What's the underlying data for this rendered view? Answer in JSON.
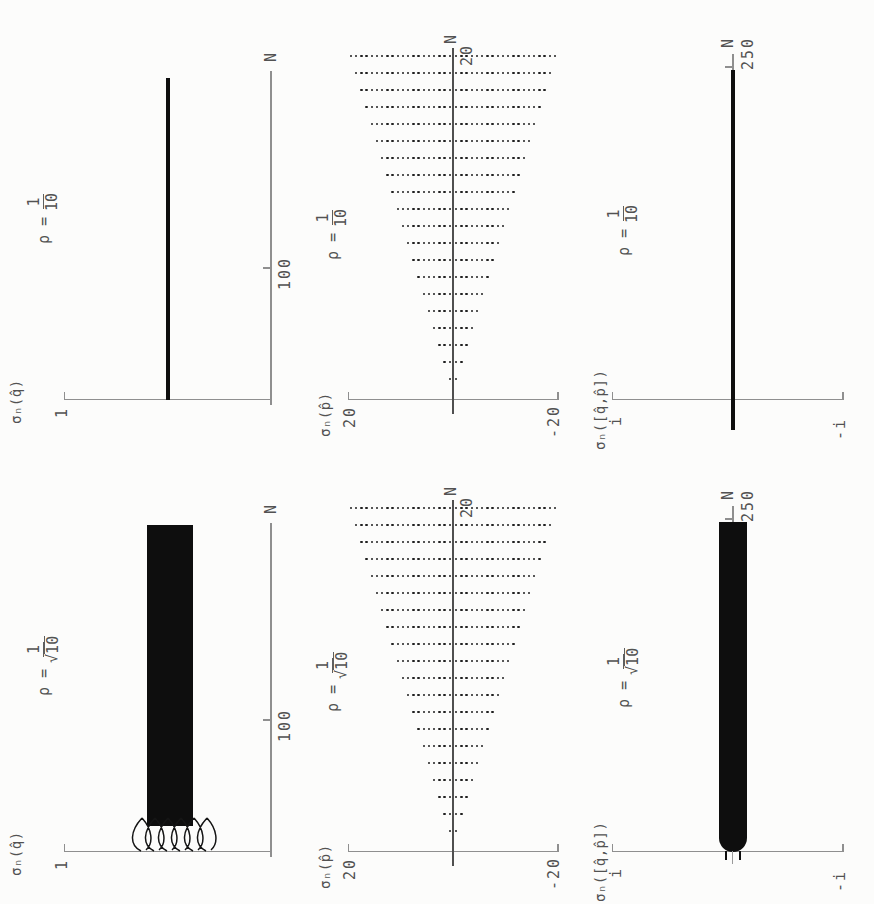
{
  "figure": {
    "background": "#fcfcfb",
    "ink_color": "#0e0e0e",
    "axis_color": "#8f8f8f",
    "text_color": "#525252",
    "orientation": "plots rotated 90 degrees counter-clockwise on the scanned page",
    "grid_layout": "3 columns (q, p, commutator) by 2 rows (rho=1/10, rho=1/sqrt(10))"
  },
  "plots": [
    {
      "id": "sigma-q-rho-1-10",
      "ylabel": "σₙ(q̂)",
      "y_tick_label": "1",
      "x_tick_label": "100",
      "xlabel": "N",
      "title": {
        "prefix": "ρ =",
        "numerator": "1",
        "denominator": "10",
        "sqrt_sign": "",
        "radical": false
      }
    },
    {
      "id": "sigma-p-rho-1-10",
      "ylabel": "σₙ(p̂)",
      "y_tick_top_label": "20",
      "y_tick_bottom_label": "-20",
      "x_tick_label": "20",
      "xlabel": "N",
      "title": {
        "prefix": "ρ =",
        "numerator": "1",
        "denominator": "10",
        "sqrt_sign": "",
        "radical": false
      }
    },
    {
      "id": "sigma-comm-rho-1-10",
      "ylabel": "σₙ([q̂,p̂])",
      "y_tick_top_label": "i",
      "y_tick_bottom_label": "-i",
      "x_tick_label": "250",
      "xlabel": "N",
      "title": {
        "prefix": "ρ =",
        "numerator": "1",
        "denominator": "10",
        "sqrt_sign": "",
        "radical": false
      }
    },
    {
      "id": "sigma-q-rho-1-sqrt10",
      "ylabel": "σₙ(q̂)",
      "y_tick_label": "1",
      "x_tick_label": "100",
      "xlabel": "N",
      "title": {
        "prefix": "ρ =",
        "numerator": "1",
        "denominator": "10",
        "sqrt_sign": "√",
        "radical": true
      }
    },
    {
      "id": "sigma-p-rho-1-sqrt10",
      "ylabel": "σₙ(p̂)",
      "y_tick_top_label": "20",
      "y_tick_bottom_label": "-20",
      "x_tick_label": "20",
      "xlabel": "N",
      "title": {
        "prefix": "ρ =",
        "numerator": "1",
        "denominator": "10",
        "sqrt_sign": "√",
        "radical": true
      }
    },
    {
      "id": "sigma-comm-rho-1-sqrt10",
      "ylabel": "σₙ([q̂,p̂])",
      "y_tick_top_label": "i",
      "y_tick_bottom_label": "-i",
      "x_tick_label": "250",
      "xlabel": "N",
      "title": {
        "prefix": "ρ =",
        "numerator": "1",
        "denominator": "10",
        "sqrt_sign": "√",
        "radical": true
      }
    }
  ],
  "chart_data": [
    {
      "id": "sigma_q_rho_1_over_10",
      "type": "line",
      "title": "ρ = 1/10",
      "xlabel": "N",
      "ylabel": "σ_N(q̂)",
      "x_range": [
        0,
        255
      ],
      "x_ticks": [
        100
      ],
      "y_ticks": [
        1
      ],
      "grid": false,
      "legend": "none",
      "series": [
        {
          "name": "σ_N(q̂)",
          "style": "solid thick line",
          "x_span": [
            0,
            244
          ],
          "y_constant": 0.5
        }
      ],
      "note": "variance of q̂ stays constant at ≈0.5 for all N"
    },
    {
      "id": "sigma_p_rho_1_over_10",
      "type": "scatter",
      "title": "ρ = 1/10",
      "xlabel": "N",
      "ylabel": "σ_N(p̂)",
      "x_range": [
        0,
        21
      ],
      "x_ticks": [
        20
      ],
      "y_range": [
        -21,
        21
      ],
      "y_ticks": [
        20,
        -20
      ],
      "grid": false,
      "N_values": [
        1,
        2,
        3,
        4,
        5,
        6,
        7,
        8,
        9,
        10,
        11,
        12,
        13,
        14,
        15,
        16,
        17,
        18,
        19,
        20
      ],
      "sigma_rule": "for each N there are dots at σ = ±1, ±2, …, ±N (no dot at σ=0)",
      "sigma_step": 1,
      "max_abs_sigma_at_N20": 20,
      "note": "triangular fan of dots spreading linearly with N, symmetric about the N axis"
    },
    {
      "id": "sigma_comm_rho_1_over_10",
      "type": "line",
      "title": "ρ = 1/10",
      "xlabel": "N",
      "ylabel": "σ_N([q̂,p̂])",
      "x_range": [
        0,
        255
      ],
      "x_ticks": [
        250
      ],
      "y_ticks": [
        "i",
        "-i"
      ],
      "grid": false,
      "series": [
        {
          "name": "σ_N([q̂,p̂])",
          "style": "solid thick line",
          "x_span": [
            0,
            248
          ],
          "y_constant": 0
        }
      ],
      "note": "commutator variance pinned at ≈0 along the N axis"
    },
    {
      "id": "sigma_q_rho_1_over_sqrt10",
      "type": "band",
      "title": "ρ = 1/√10",
      "xlabel": "N",
      "ylabel": "σ_N(q̂)",
      "x_range": [
        0,
        255
      ],
      "x_ticks": [
        100
      ],
      "y_ticks": [
        1
      ],
      "grid": false,
      "band": {
        "x_span": [
          20,
          248
        ],
        "y_low": 0.38,
        "y_high": 0.6
      },
      "transient": {
        "x_span": [
          0,
          20
        ],
        "y_min": 0.3,
        "y_max": 0.63,
        "description": "fast oscillation traces fanning out near N≈0 before merging into the solid band"
      }
    },
    {
      "id": "sigma_p_rho_1_over_sqrt10",
      "type": "scatter",
      "title": "ρ = 1/√10",
      "xlabel": "N",
      "ylabel": "σ_N(p̂)",
      "x_range": [
        0,
        21
      ],
      "x_ticks": [
        20
      ],
      "y_range": [
        -21,
        21
      ],
      "y_ticks": [
        20,
        -20
      ],
      "grid": false,
      "N_values": [
        1,
        2,
        3,
        4,
        5,
        6,
        7,
        8,
        9,
        10,
        11,
        12,
        13,
        14,
        15,
        16,
        17,
        18,
        19,
        20
      ],
      "sigma_rule": "for each N there are dots at σ = ±1, ±2, …, ±N (no dot at σ=0)",
      "sigma_step": 1,
      "max_abs_sigma_at_N20": 20,
      "note": "same triangular dot fan as the ρ=1/10 case"
    },
    {
      "id": "sigma_comm_rho_1_over_sqrt10",
      "type": "band",
      "title": "ρ = 1/√10",
      "xlabel": "N",
      "ylabel": "σ_N([q̂,p̂])",
      "x_range": [
        0,
        255
      ],
      "x_ticks": [
        250
      ],
      "y_ticks": [
        "i",
        "-i"
      ],
      "grid": false,
      "band": {
        "x_span": [
          0,
          248
        ],
        "y_low": -0.12,
        "y_high": 0.12
      },
      "note": "oscillation band centred on 0 with a rounded onset touching the axis at N≈0"
    }
  ]
}
